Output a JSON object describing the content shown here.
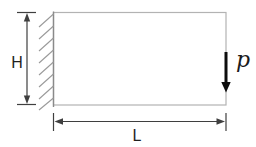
{
  "figure": {
    "type": "mechanics-diagram",
    "labels": {
      "height": "H",
      "length": "L",
      "load": "p"
    },
    "colors": {
      "background": "#ffffff",
      "plate_outline": "#b3b3b3",
      "wall_line": "#8a8a8a",
      "hatching": "#9a9a9a",
      "dimension": "#3f3f3f",
      "load_arrow": "#0d0d0d",
      "text": "#1f1f1f"
    }
  }
}
